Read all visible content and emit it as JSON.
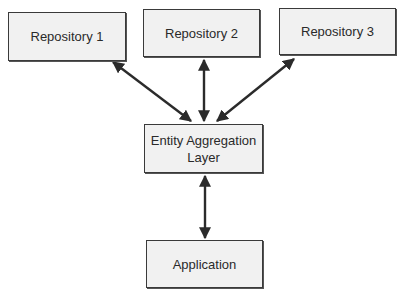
{
  "diagram": {
    "nodes": [
      {
        "id": "repo1",
        "label": "Repository 1"
      },
      {
        "id": "repo2",
        "label": "Repository 2"
      },
      {
        "id": "repo3",
        "label": "Repository 3"
      },
      {
        "id": "eal",
        "label_line1": "Entity Aggregation",
        "label_line2": "Layer"
      },
      {
        "id": "app",
        "label": "Application"
      }
    ],
    "edges": [
      {
        "from": "repo1",
        "to": "eal",
        "direction": "bidirectional"
      },
      {
        "from": "repo2",
        "to": "eal",
        "direction": "bidirectional"
      },
      {
        "from": "repo3",
        "to": "eal",
        "direction": "bidirectional"
      },
      {
        "from": "eal",
        "to": "app",
        "direction": "bidirectional"
      }
    ],
    "colors": {
      "box_fill": "#f1f1f1",
      "box_border": "#3a3a3a",
      "arrow": "#2b2b2b"
    }
  }
}
